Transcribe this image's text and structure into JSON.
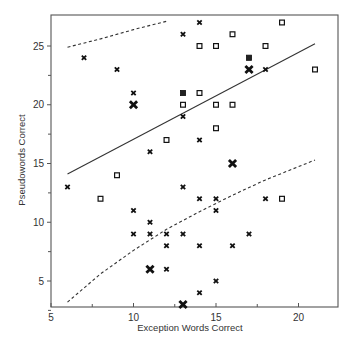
{
  "chart_data": {
    "type": "scatter",
    "title": "",
    "xlabel": "Exception Words Correct",
    "ylabel": "Pseudowords Correct",
    "xlim": [
      5,
      22.4
    ],
    "ylim": [
      2.2,
      27.1
    ],
    "xticks": [
      5,
      10,
      15,
      20
    ],
    "yticks": [
      5,
      10,
      15,
      20,
      25
    ],
    "grid": false,
    "legend": null,
    "series": [
      {
        "name": "cross markers",
        "marker": "x",
        "points": [
          [
            7,
            24
          ],
          [
            9,
            23
          ],
          [
            10,
            21
          ],
          [
            13,
            26
          ],
          [
            14,
            27
          ],
          [
            18,
            23
          ],
          [
            13,
            19
          ],
          [
            14,
            17
          ],
          [
            11,
            16
          ],
          [
            6,
            13
          ],
          [
            13,
            13
          ],
          [
            14,
            12
          ],
          [
            15,
            12
          ],
          [
            15,
            11
          ],
          [
            18,
            12
          ],
          [
            10,
            11
          ],
          [
            11,
            10
          ],
          [
            10,
            9
          ],
          [
            11,
            9
          ],
          [
            12,
            9
          ],
          [
            13,
            9
          ],
          [
            17,
            9
          ],
          [
            12,
            8
          ],
          [
            14,
            8
          ],
          [
            16,
            8
          ],
          [
            12,
            6
          ],
          [
            15,
            5
          ],
          [
            14,
            4
          ]
        ]
      },
      {
        "name": "large cross markers",
        "marker": "X-large",
        "points": [
          [
            10,
            20
          ],
          [
            17,
            23
          ],
          [
            16,
            15
          ],
          [
            11,
            6
          ],
          [
            13,
            3
          ]
        ]
      },
      {
        "name": "open square markers",
        "marker": "square-open",
        "points": [
          [
            16,
            26
          ],
          [
            19,
            27
          ],
          [
            14,
            25
          ],
          [
            15,
            25
          ],
          [
            18,
            25
          ],
          [
            21,
            23
          ],
          [
            14,
            21
          ],
          [
            13,
            20
          ],
          [
            15,
            20
          ],
          [
            16,
            20
          ],
          [
            15,
            18
          ],
          [
            12,
            17
          ],
          [
            9,
            14
          ],
          [
            8,
            12
          ],
          [
            19,
            12
          ]
        ]
      },
      {
        "name": "filled square markers",
        "marker": "square-filled",
        "points": [
          [
            17,
            24
          ],
          [
            13,
            21
          ]
        ]
      }
    ],
    "lines": [
      {
        "name": "regression line",
        "style": "solid",
        "points": [
          [
            6,
            14.1
          ],
          [
            21,
            25.2
          ]
        ]
      },
      {
        "name": "upper prediction bound",
        "style": "dashed",
        "points": [
          [
            6,
            24.9
          ],
          [
            8,
            25.6
          ],
          [
            10,
            26.4
          ],
          [
            12,
            27.1
          ]
        ]
      },
      {
        "name": "lower prediction bound",
        "style": "dashed",
        "points": [
          [
            6,
            3.2
          ],
          [
            8,
            5.6
          ],
          [
            10,
            7.6
          ],
          [
            12,
            9.4
          ],
          [
            14,
            10.9
          ],
          [
            16,
            12.3
          ],
          [
            18,
            13.6
          ],
          [
            21,
            15.3
          ]
        ]
      }
    ]
  }
}
